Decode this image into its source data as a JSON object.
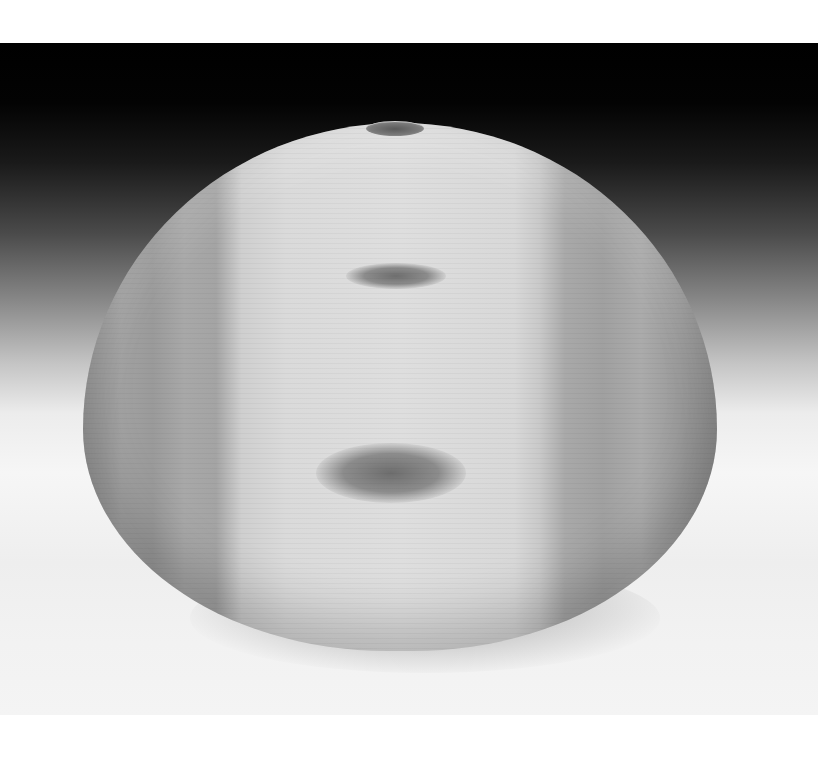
{
  "image": {
    "subject": "turned wooden hollow vessel",
    "description": "Grayscale photograph of a wide, round turned-wood hollow form with a small top opening, pale heartwood center band with two dark knots, darker sapwood bands on both sides, set against a black-to-white gradient backdrop with a soft shadow beneath",
    "colors": {
      "backdrop_top": "#000000",
      "backdrop_bottom": "#f4f4f4",
      "vessel_center": "#dedede",
      "vessel_edges": "#8e8e8e",
      "knots": "#6e6e6e",
      "page_background": "#ffffff"
    }
  }
}
